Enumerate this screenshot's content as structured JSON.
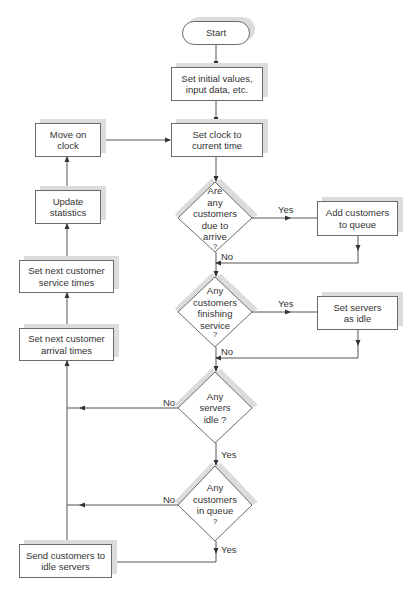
{
  "diagram": {
    "type": "flowchart",
    "colors": {
      "stroke": "#6a6a6a",
      "shadow": "#dcdcdc",
      "text": "#333333",
      "background": "#ffffff"
    },
    "nodes": {
      "start": {
        "label": "Start"
      },
      "init": {
        "line1": "Set initial values,",
        "line2": "input data, etc."
      },
      "clock": {
        "line1": "Set clock to",
        "line2": "current time"
      },
      "q_arrive": {
        "line1": "Are",
        "line2": "any",
        "line3": "customers",
        "line4": "due to",
        "line5": "arrive",
        "line6": "?"
      },
      "add_queue": {
        "line1": "Add customers",
        "line2": "to queue"
      },
      "q_finish": {
        "line1": "Any",
        "line2": "customers",
        "line3": "finishing",
        "line4": "service",
        "line5": "?"
      },
      "set_idle": {
        "line1": "Set servers",
        "line2": "as idle"
      },
      "q_idle": {
        "line1": "Any",
        "line2": "servers",
        "line3": "idle ?"
      },
      "q_queue": {
        "line1": "Any",
        "line2": "customers",
        "line3": "in queue",
        "line4": "?"
      },
      "send": {
        "line1": "Send customers to",
        "line2": "idle servers"
      },
      "next_arrival": {
        "line1": "Set next customer",
        "line2": "arrival times"
      },
      "next_service": {
        "line1": "Set next customer",
        "line2": "service times"
      },
      "update_stats": {
        "line1": "Update",
        "line2": "statistics"
      },
      "move_clock": {
        "line1": "Move on",
        "line2": "clock"
      }
    },
    "edge_labels": {
      "arrive_yes": "Yes",
      "arrive_no": "No",
      "finish_yes": "Yes",
      "finish_no": "No",
      "idle_no": "No",
      "idle_yes": "Yes",
      "queue_no": "No",
      "queue_yes": "Yes"
    }
  }
}
